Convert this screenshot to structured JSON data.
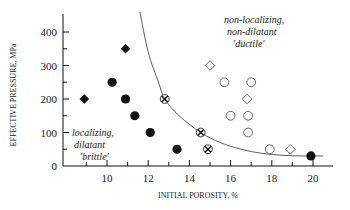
{
  "chart_data": {
    "type": "scatter",
    "title": "",
    "xlabel": "INITIAL POROSITY, %",
    "ylabel": "EFFECTIVE PRESSURE, MPa",
    "xlim": [
      8,
      21
    ],
    "ylim": [
      0,
      450
    ],
    "x_ticks": [
      10,
      12,
      14,
      16,
      18,
      20
    ],
    "x_minor_ticks": [
      9,
      11,
      13,
      15,
      17,
      19
    ],
    "y_ticks": [
      0,
      100,
      200,
      300,
      400
    ],
    "y_minor_ticks": [
      50,
      150,
      250,
      350
    ],
    "grid": false,
    "legend": null,
    "series": [
      {
        "name": "localizing, dilatant (filled circles)",
        "marker": "filled-circle",
        "points": [
          [
            10.25,
            250
          ],
          [
            10.9,
            200
          ],
          [
            11.35,
            150
          ],
          [
            12.1,
            100
          ],
          [
            13.4,
            50
          ],
          [
            19.9,
            30
          ]
        ]
      },
      {
        "name": "localizing, dilatant (filled diamonds)",
        "marker": "filled-diamond",
        "points": [
          [
            8.9,
            200
          ],
          [
            10.9,
            350
          ]
        ]
      },
      {
        "name": "transitional (crossed circles)",
        "marker": "crossed-circle",
        "points": [
          [
            12.8,
            200
          ],
          [
            14.55,
            100
          ],
          [
            14.9,
            50
          ]
        ]
      },
      {
        "name": "non-localizing, non-dilatant (open circles)",
        "marker": "open-circle",
        "points": [
          [
            15.7,
            250
          ],
          [
            17.0,
            250
          ],
          [
            16.0,
            150
          ],
          [
            16.85,
            150
          ],
          [
            16.85,
            100
          ],
          [
            17.9,
            50
          ]
        ]
      },
      {
        "name": "non-localizing, non-dilatant (open diamonds)",
        "marker": "open-diamond",
        "points": [
          [
            15.0,
            300
          ],
          [
            16.8,
            200
          ],
          [
            18.9,
            50
          ]
        ]
      }
    ],
    "boundary_curve": {
      "name": "brittle-ductile transition",
      "points": [
        [
          11.6,
          460
        ],
        [
          12.0,
          340
        ],
        [
          12.5,
          250
        ],
        [
          12.8,
          200
        ],
        [
          13.5,
          150
        ],
        [
          14.55,
          100
        ],
        [
          15.5,
          70
        ],
        [
          16.5,
          50
        ],
        [
          17.5,
          38
        ],
        [
          18.5,
          32
        ],
        [
          19.5,
          30
        ],
        [
          20.5,
          30
        ]
      ]
    },
    "annotations": [
      {
        "text": [
          "localizing,",
          "dilatant",
          "'brittle'"
        ],
        "x": 9.3,
        "y": 90
      },
      {
        "text": [
          "non-localizing,",
          "non-dilatant",
          "'ductile'"
        ],
        "x": 18.2,
        "y": 410
      }
    ]
  }
}
